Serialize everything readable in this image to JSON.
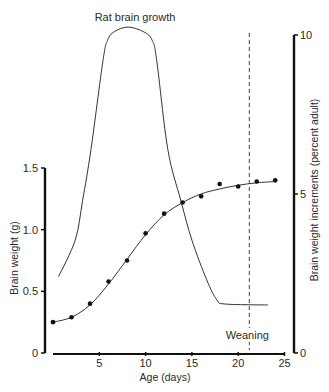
{
  "chart_data": {
    "type": "line",
    "title": "Rat brain growth",
    "xlabel": "Age (days)",
    "ylabel": "Brain weight (g)",
    "ylabel_right": "Brain weight increments (percent adult)",
    "xlim": [
      0,
      25
    ],
    "ylim": [
      0,
      1.5
    ],
    "ylim_right": [
      0,
      10
    ],
    "x_ticks": [
      5,
      10,
      15,
      20,
      25
    ],
    "y_ticks": [
      {
        "value": 0,
        "label": "0"
      },
      {
        "value": 0.5,
        "label": "0.5"
      },
      {
        "value": 1.0,
        "label": "1.0"
      },
      {
        "value": 1.5,
        "label": "1.5"
      }
    ],
    "y_ticks_right": [
      {
        "value": 0,
        "label": "0"
      },
      {
        "value": 5,
        "label": "5"
      },
      {
        "value": 10,
        "label": "10"
      }
    ],
    "grid": false,
    "series": [
      {
        "name": "Brain weight (observed)",
        "axis": "left",
        "style": "points",
        "x": [
          0,
          2,
          4,
          6,
          8,
          10,
          12,
          14,
          16,
          18,
          20,
          22,
          24
        ],
        "values": [
          0.25,
          0.29,
          0.4,
          0.58,
          0.75,
          0.97,
          1.13,
          1.22,
          1.27,
          1.37,
          1.35,
          1.39,
          1.4
        ]
      },
      {
        "name": "Brain weight (fitted curve)",
        "axis": "left",
        "style": "line",
        "x": [
          0,
          2,
          4,
          6,
          8,
          10,
          12,
          14,
          16,
          18,
          20,
          22,
          24
        ],
        "values": [
          0.25,
          0.29,
          0.39,
          0.56,
          0.76,
          0.96,
          1.12,
          1.22,
          1.29,
          1.33,
          1.36,
          1.38,
          1.39
        ]
      },
      {
        "name": "Brain growth rate (percent adult)",
        "axis": "right",
        "style": "line",
        "x": [
          0.6,
          2.4,
          3.2,
          4.1,
          5.4,
          5.9,
          6.6,
          8.1,
          9.8,
          10.7,
          11.2,
          12.4,
          13.8,
          15.0,
          16.6,
          17.7,
          18.6,
          23.2
        ],
        "values": [
          2.4,
          3.55,
          4.8,
          6.4,
          9.2,
          9.84,
          10.1,
          10.25,
          10.1,
          9.84,
          9.2,
          6.4,
          4.8,
          3.55,
          2.3,
          1.67,
          1.54,
          1.51
        ]
      }
    ],
    "annotations": [
      {
        "type": "vline",
        "x": 21.2,
        "style": "dashed",
        "label": "Weaning"
      }
    ]
  }
}
